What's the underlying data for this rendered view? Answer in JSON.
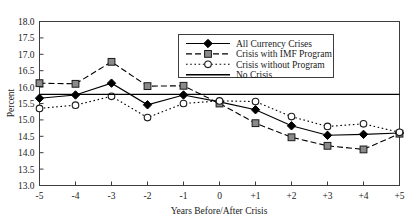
{
  "chart_data": {
    "type": "line",
    "title": "",
    "xlabel": "Years Before/After Crisis",
    "ylabel": "Percent",
    "x": [
      -5,
      -4,
      -3,
      -2,
      -1,
      0,
      1,
      2,
      3,
      4,
      5
    ],
    "xtick_labels": [
      "-5",
      "-4",
      "-3",
      "-2",
      "-1",
      "0",
      "+1",
      "+2",
      "+3",
      "+4",
      "+5"
    ],
    "ytick_labels": [
      "13.0",
      "13.5",
      "14.0",
      "14.5",
      "15.0",
      "15.5",
      "16.0",
      "16.5",
      "17.0",
      "17.5",
      "18.0"
    ],
    "ylim": [
      13.0,
      18.0
    ],
    "xlim": [
      -5,
      5
    ],
    "grid": false,
    "legend_position": "top-right",
    "series": [
      {
        "name": "All Currency Crises",
        "marker": "filled-diamond",
        "line": "solid",
        "color": "#000000",
        "values": [
          15.66,
          15.76,
          16.12,
          15.46,
          15.76,
          15.55,
          15.31,
          14.82,
          14.53,
          14.56,
          14.6
        ]
      },
      {
        "name": "Crisis with IMF Program",
        "marker": "filled-square",
        "line": "dashed",
        "color": "#000000",
        "values": [
          16.12,
          16.1,
          16.77,
          16.03,
          16.04,
          15.5,
          14.9,
          14.47,
          14.21,
          14.1,
          14.58
        ]
      },
      {
        "name": "Crisis without Program",
        "marker": "open-circle",
        "line": "dotted",
        "color": "#000000",
        "values": [
          15.35,
          15.45,
          15.72,
          15.07,
          15.5,
          15.58,
          15.56,
          15.1,
          14.8,
          14.88,
          14.62
        ]
      },
      {
        "name": "No Crisis",
        "marker": "none",
        "line": "solid-plain",
        "color": "#000000",
        "constant_value": 15.78
      }
    ]
  },
  "legend": {
    "entries": [
      {
        "label": "All Currency Crises"
      },
      {
        "label": "Crisis with IMF Program"
      },
      {
        "label": "Crisis without Program"
      },
      {
        "label": "No Crisis"
      }
    ]
  }
}
